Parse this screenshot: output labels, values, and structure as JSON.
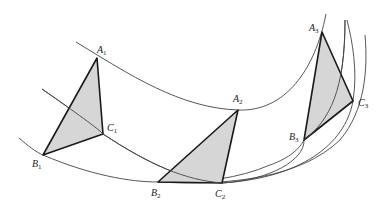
{
  "figure": {
    "colors": {
      "triangle_fill": "#d6d6d6",
      "triangle_stroke": "#1a1a1a",
      "curve_stroke": "#444444"
    },
    "triangles": [
      {
        "name": "triangle-1",
        "vertices": {
          "A": [
            97,
            58
          ],
          "B": [
            43,
            155
          ],
          "C": [
            103,
            134
          ]
        },
        "labels": {
          "A": {
            "letter": "A",
            "sub": "1"
          },
          "B": {
            "letter": "B",
            "sub": "1"
          },
          "C": {
            "letter": "C",
            "sub": "1"
          }
        }
      },
      {
        "name": "triangle-2",
        "vertices": {
          "A": [
            238,
            110
          ],
          "B": [
            158,
            182
          ],
          "C": [
            222,
            183
          ]
        },
        "labels": {
          "A": {
            "letter": "A",
            "sub": "2"
          },
          "B": {
            "letter": "B",
            "sub": "2"
          },
          "C": {
            "letter": "C",
            "sub": "2"
          }
        }
      },
      {
        "name": "triangle-3",
        "vertices": {
          "A": [
            322,
            32
          ],
          "B": [
            304,
            140
          ],
          "C": [
            353,
            101
          ]
        },
        "labels": {
          "A": {
            "letter": "A",
            "sub": "3"
          },
          "B": {
            "letter": "B",
            "sub": "3"
          },
          "C": {
            "letter": "C",
            "sub": "3"
          }
        }
      }
    ],
    "curves": [
      {
        "name": "path-of-A",
        "passes_through": [
          "A1",
          "A2",
          "A3"
        ]
      },
      {
        "name": "path-of-C",
        "passes_through": [
          "C1",
          "C2",
          "C3"
        ]
      },
      {
        "name": "path-of-B",
        "passes_through": [
          "B1",
          "B2",
          "B3"
        ]
      }
    ]
  }
}
